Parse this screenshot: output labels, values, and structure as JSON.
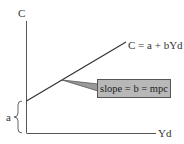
{
  "diagram": {
    "y_axis_label": "C",
    "x_axis_label": "Yd",
    "line_label": "C = a + bYd",
    "intercept_label": "a",
    "callout_text": "slope = b = mpc",
    "colors": {
      "axis": "#555555",
      "line": "#333333",
      "callout_fill": "#b8b8b8",
      "callout_border": "#555555"
    }
  }
}
